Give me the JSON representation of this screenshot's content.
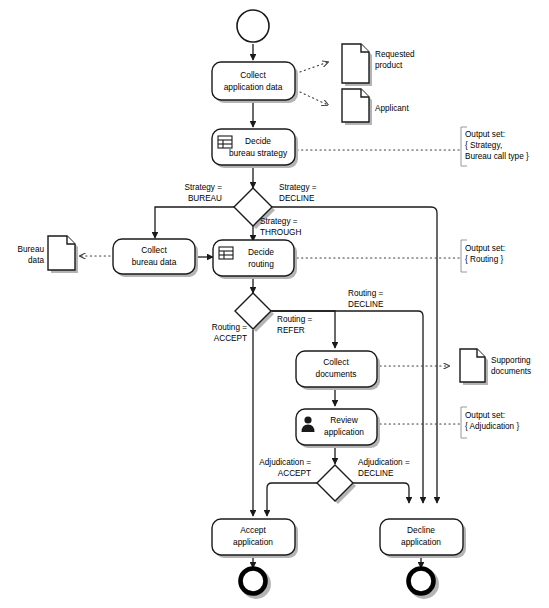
{
  "diagram": {
    "type": "bpmn-process-flow",
    "colors": {
      "stroke": "#1a1a1a",
      "fill": "#ffffff",
      "shadow": "#b4b4b4",
      "association": "#3c3c3c",
      "annotation_bracket": "#8c8c8c"
    }
  },
  "events": {
    "start": {
      "name": "start-event",
      "label": ""
    },
    "end_accept": {
      "name": "end-event-accept",
      "label": ""
    },
    "end_decline": {
      "name": "end-event-decline",
      "label": ""
    }
  },
  "tasks": [
    {
      "id": "collect_application_data",
      "line1": "Collect",
      "line2": "application data",
      "icon": "none"
    },
    {
      "id": "decide_bureau_strategy",
      "line1": "Decide",
      "line2": "bureau strategy",
      "icon": "business-rule-icon"
    },
    {
      "id": "collect_bureau_data",
      "line1": "Collect",
      "line2": "bureau data",
      "icon": "none"
    },
    {
      "id": "decide_routing",
      "line1": "Decide",
      "line2": "routing",
      "icon": "business-rule-icon"
    },
    {
      "id": "collect_documents",
      "line1": "Collect",
      "line2": "documents",
      "icon": "none"
    },
    {
      "id": "review_application",
      "line1": "Review",
      "line2": "application",
      "icon": "user-task-icon"
    },
    {
      "id": "accept_application",
      "line1": "Accept",
      "line2": "application",
      "icon": "none"
    },
    {
      "id": "decline_application",
      "line1": "Decline",
      "line2": "application",
      "icon": "none"
    }
  ],
  "gateways": [
    {
      "id": "gateway_strategy",
      "label": ""
    },
    {
      "id": "gateway_routing",
      "label": ""
    },
    {
      "id": "gateway_adjudication",
      "label": ""
    }
  ],
  "edge_labels": {
    "strategy_bureau": {
      "line1": "Strategy =",
      "line2": "BUREAU"
    },
    "strategy_decline": {
      "line1": "Strategy =",
      "line2": "DECLINE"
    },
    "strategy_through": {
      "line1": "Strategy =",
      "line2": "THROUGH"
    },
    "routing_accept": {
      "line1": "Routing =",
      "line2": "ACCEPT"
    },
    "routing_refer": {
      "line1": "Routing =",
      "line2": "REFER"
    },
    "routing_decline": {
      "line1": "Routing =",
      "line2": "DECLINE"
    },
    "adjudication_accept": {
      "line1": "Adjudication =",
      "line2": "ACCEPT"
    },
    "adjudication_decline": {
      "line1": "Adjudication =",
      "line2": "DECLINE"
    }
  },
  "data_objects": [
    {
      "id": "requested_product",
      "line1": "Requested",
      "line2": "product",
      "side": "right"
    },
    {
      "id": "applicant",
      "line1": "Applicant",
      "line2": "",
      "side": "right"
    },
    {
      "id": "bureau_data",
      "line1": "Bureau",
      "line2": "data",
      "side": "left"
    },
    {
      "id": "supporting_documents",
      "line1": "Supporting",
      "line2": "documents",
      "side": "right"
    }
  ],
  "annotations": [
    {
      "id": "output_set_strategy",
      "line1": "Output set:",
      "line2": "{ Strategy,",
      "line3": "Bureau call type }"
    },
    {
      "id": "output_set_routing",
      "line1": "Output set:",
      "line2": "{ Routing }",
      "line3": ""
    },
    {
      "id": "output_set_adjudication",
      "line1": "Output set:",
      "line2": "{ Adjudication }",
      "line3": ""
    }
  ]
}
